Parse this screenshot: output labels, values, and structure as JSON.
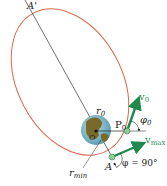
{
  "diagram": {
    "labels": {
      "apogee": "A'",
      "perigee": "A",
      "focus": "O",
      "launch_point": "P",
      "launch_point_sub": "0",
      "r0": "r",
      "r0_sub": "0",
      "rmin": "r",
      "rmin_sub": "min",
      "v0": "v",
      "v0_sub": "0",
      "vmax": "v",
      "vmax_sub": "max",
      "phi0": "φ",
      "phi0_sub": "0",
      "phi_eq": "φ = 90°"
    },
    "colors": {
      "orbit": "#d9694a",
      "velocity": "#1f8a4c",
      "axis": "#333333",
      "earth_ocean": "#7fb8c9",
      "earth_land": "#7a6a2a"
    }
  }
}
